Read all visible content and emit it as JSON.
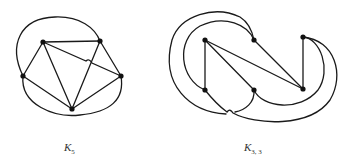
{
  "figures": [
    {
      "id": "k5",
      "caption": {
        "main": "K",
        "sub": "5"
      },
      "node_color": "#111111",
      "edge_color": "#1a1a1a"
    },
    {
      "id": "k33",
      "caption": {
        "main": "K",
        "sub": "3, 3"
      },
      "node_color": "#111111",
      "edge_color": "#1a1a1a"
    }
  ]
}
